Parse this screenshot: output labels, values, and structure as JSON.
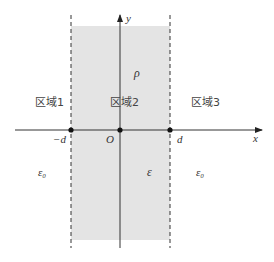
{
  "diagram": {
    "axes": {
      "x_label": "x",
      "y_label": "y",
      "origin_label": "O"
    },
    "boundaries": {
      "left_label": "−d",
      "right_label": "d"
    },
    "regions": [
      {
        "name": "区域1",
        "permittivity": "ε₀"
      },
      {
        "name": "区域2",
        "permittivity": "ε",
        "charge_density": "ρ"
      },
      {
        "name": "区域3",
        "permittivity": "ε₀"
      }
    ],
    "colors": {
      "slab_fill": "#e4e4e4",
      "line": "#222222"
    }
  }
}
